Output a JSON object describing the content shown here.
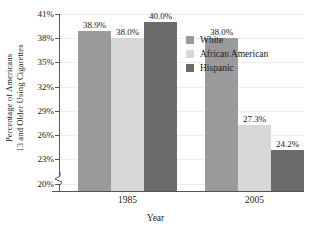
{
  "chart_data": {
    "type": "bar",
    "title": "",
    "subtitle": "",
    "xlabel": "Year",
    "ylabel_line1": "Percentage of Americans",
    "ylabel_line2": "13 and Older Using Cigarettes",
    "categories": [
      "1985",
      "2005"
    ],
    "series": [
      {
        "name": "White",
        "color": "#9a9a9a",
        "values": [
          38.9,
          38.0
        ],
        "labels": [
          "38.9%",
          "38.0%"
        ]
      },
      {
        "name": "African American",
        "color": "#d8d8d8",
        "values": [
          38.0,
          27.3
        ],
        "labels": [
          "38.0%",
          "27.3%"
        ]
      },
      {
        "name": "Hispanic",
        "color": "#6b6b6b",
        "values": [
          40.0,
          24.2
        ],
        "labels": [
          "40.0%",
          "24.2%"
        ]
      }
    ],
    "grouped_values": {
      "1985": {
        "White": 38.9,
        "African American": 38.0,
        "Hispanic": 40.0
      },
      "2005": {
        "White": 27.3,
        "African American": 27.3,
        "Hispanic": 24.2
      }
    },
    "ylim": [
      19.1,
      41.0
    ],
    "y_axis_break": true,
    "ytick_values": [
      20,
      23,
      26,
      29,
      32,
      35,
      38,
      41
    ],
    "ytick_labels": [
      "20%",
      "23%",
      "26%",
      "29%",
      "32%",
      "35%",
      "38%",
      "41%"
    ],
    "grid": "horizontal",
    "legend_position": "upper-right-inside",
    "legend_entries": [
      "White",
      "African American",
      "Hispanic"
    ],
    "annotations": [
      "38.9%",
      "38.0%",
      "40.0%",
      "27.3%",
      "27.3%",
      "24.2%"
    ]
  },
  "bars": [
    {
      "group": "1985",
      "series": "White",
      "label": "38.9%",
      "value": 38.9,
      "color": "#9a9a9a"
    },
    {
      "group": "1985",
      "series": "African American",
      "label": "38.0%",
      "value": 38.0,
      "color": "#d8d8d8"
    },
    {
      "group": "1985",
      "series": "Hispanic",
      "label": "40.0%",
      "value": 40.0,
      "color": "#6b6b6b"
    },
    {
      "group": "2005",
      "series": "White",
      "label": "27.3%",
      "value": 27.3,
      "color": "#9a9a9a"
    },
    {
      "group": "2005",
      "series": "African American",
      "label": "27.3%",
      "value": 27.3,
      "color": "#d8d8d8"
    },
    {
      "group": "2005",
      "series": "Hispanic",
      "label": "24.2%",
      "value": 24.2,
      "color": "#6b6b6b"
    }
  ]
}
